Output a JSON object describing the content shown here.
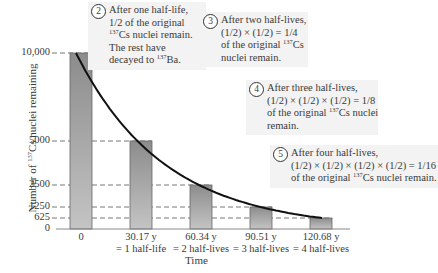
{
  "chart_data": {
    "type": "bar",
    "title": "",
    "xlabel": "Time",
    "ylabel": "Number of 137Cs nuclei remaining",
    "ylabel_parts": {
      "pre": "Number of ",
      "sup": "137",
      "post": "Cs nuclei remaining"
    },
    "ylim": [
      0,
      10000
    ],
    "yticks": [
      0,
      625,
      1250,
      2500,
      5000,
      10000
    ],
    "ytick_labels": [
      "0",
      "625",
      "1250",
      "2500",
      "5000",
      "10,000"
    ],
    "categories": [
      "0",
      "30.17 y = 1 half-life",
      "60.34 y = 2 half-lives",
      "90.51 y = 3 half-lives",
      "120.68 y = 4 half-lives"
    ],
    "xtick_labels": [
      {
        "line1": "0",
        "line2": ""
      },
      {
        "line1": "30.17 y",
        "line2": "= 1 half-life"
      },
      {
        "line1": "60.34 y",
        "line2": "= 2 half-lives"
      },
      {
        "line1": "90.51 y",
        "line2": "= 3 half-lives"
      },
      {
        "line1": "120.68 y",
        "line2": "= 4 half-lives"
      }
    ],
    "x_years": [
      0,
      30.17,
      60.34,
      90.51,
      120.68
    ],
    "values": [
      10000,
      5000,
      2500,
      1250,
      625
    ],
    "curve": "exponential decay N = 10000 * (1/2)^(t/30.17)",
    "grid": "dashed horizontal guide lines at each bar height",
    "bar_color": "#9a9a9a",
    "curve_color": "#111111",
    "annotations": [
      {
        "num": "2",
        "lines": [
          "After one half-life,",
          "1/2 of the original",
          "{137}Cs nuclei remain.",
          "The rest have",
          "decayed to {137}Ba."
        ]
      },
      {
        "num": "3",
        "lines": [
          "After two half-lives,",
          "(1/2) × (1/2) = 1/4",
          "of the original {137}Cs",
          "nuclei remain."
        ]
      },
      {
        "num": "4",
        "lines": [
          "After three half-lives,",
          "(1/2) × (1/2) × (1/2) = 1/8",
          "of the original {137}Cs nuclei",
          "remain."
        ]
      },
      {
        "num": "5",
        "lines": [
          "After four half-lives,",
          "(1/2) × (1/2) × (1/2) × (1/2) = 1/16",
          "of the original {137}Cs nuclei remain."
        ]
      }
    ]
  }
}
